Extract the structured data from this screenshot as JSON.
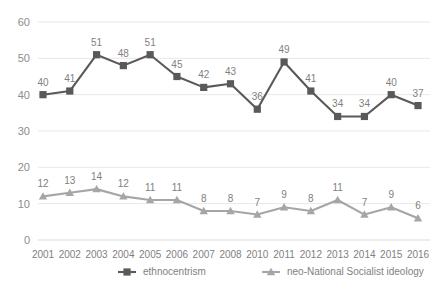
{
  "chart_data": {
    "type": "line",
    "title": "",
    "xlabel": "",
    "ylabel": "",
    "categories": [
      "2001",
      "2002",
      "2003",
      "2004",
      "2005",
      "2006",
      "2007",
      "2008",
      "2010",
      "2011",
      "2012",
      "2013",
      "2014",
      "2015",
      "2016"
    ],
    "ylim": [
      0,
      60
    ],
    "yticks": [
      0,
      10,
      20,
      30,
      40,
      50,
      60
    ],
    "grid": true,
    "legend_position": "bottom",
    "series": [
      {
        "name": "ethnocentrism",
        "color": "#595959",
        "marker": "square",
        "values": [
          40,
          41,
          51,
          48,
          51,
          45,
          42,
          43,
          36,
          49,
          41,
          34,
          34,
          40,
          37
        ]
      },
      {
        "name": "neo-National Socialist ideology",
        "color": "#a6a6a6",
        "marker": "triangle",
        "values": [
          12,
          13,
          14,
          12,
          11,
          11,
          8,
          8,
          7,
          9,
          8,
          11,
          7,
          9,
          6
        ]
      }
    ]
  },
  "legend": {
    "items": [
      {
        "label": "ethnocentrism"
      },
      {
        "label": "neo-National Socialist ideology"
      }
    ]
  },
  "axes": {
    "y_tick_labels": [
      "60",
      "50",
      "40",
      "30",
      "20",
      "10",
      "0"
    ],
    "x_tick_labels": [
      "2001",
      "2002",
      "2003",
      "2004",
      "2005",
      "2006",
      "2007",
      "2008",
      "2010",
      "2011",
      "2012",
      "2013",
      "2014",
      "2015",
      "2016"
    ]
  }
}
